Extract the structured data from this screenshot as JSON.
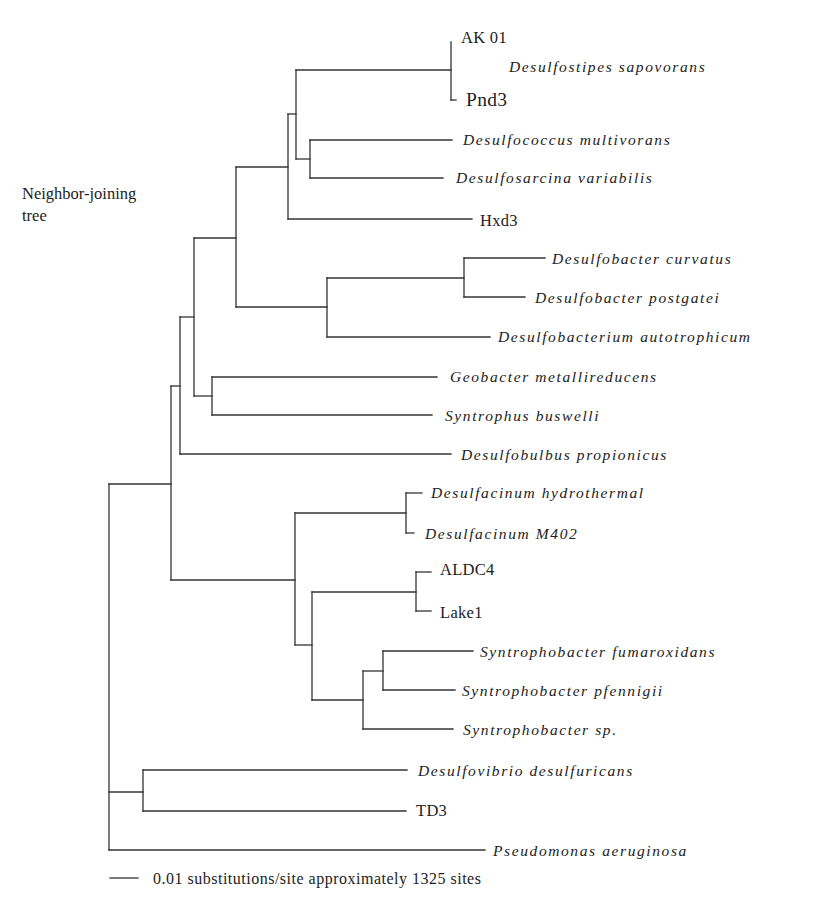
{
  "figure": {
    "title_lines": [
      "Neighbor-joining",
      "tree"
    ],
    "title_pos": {
      "x": 22,
      "y1": 193,
      "y2": 215
    },
    "line_color": "#333333",
    "text_color": "#222222"
  },
  "scale_bar": {
    "x1": 110,
    "x2": 138,
    "y": 878,
    "value": "0.01",
    "label": "0.01 substitutions/site approximately 1325 sites",
    "text_x": 153
  },
  "chart_data": {
    "type": "tree",
    "method": "Neighbor-joining",
    "title": "Neighbor-joining tree",
    "scale": "0.01 substitutions/site",
    "alignment_sites": 1325,
    "scale_label": "0.01 substitutions/site approximately 1325 sites",
    "newick": "((((((AK01,Pnd3)Desulfostipes_sapovorans,(Desulfococcus_multivorans,Desulfosarcina_variabilis)),Hxd3),((Desulfobacter_curvatus,Desulfobacter_postgatei),Desulfobacterium_autotrophicum)),(Geobacter_metallireducens,Syntrophus_buswelli)),Desulfobulbus_propionicus),((Desulfacinum_hydrothermal,Desulfacinum_M402),((ALDC4,Lake1),((Syntrophobacter_fumaroxidans,Syntrophobacter_pfennigii),Syntrophobacter_sp)))),(Desulfovibrio_desulfuricans,TD3),Pseudomonas_aeruginosa);",
    "taxa": [
      "AK 01",
      "Pnd3",
      "Desulfococcus multivorans",
      "Desulfosarcina variabilis",
      "Hxd3",
      "Desulfobacter curvatus",
      "Desulfobacter postgatei",
      "Desulfobacterium autotrophicum",
      "Geobacter metallireducens",
      "Syntrophus buswelli",
      "Desulfobulbus propionicus",
      "Desulfacinum hydrothermal",
      "Desulfacinum M402",
      "ALDC4",
      "Lake1",
      "Syntrophobacter fumaroxidans",
      "Syntrophobacter pfennigii",
      "Syntrophobacter sp.",
      "Desulfovibrio desulfuricans",
      "TD3",
      "Pseudomonas aeruginosa"
    ],
    "clade_labels": [
      {
        "label": "Desulfostipes sapovorans",
        "members": [
          "AK 01",
          "Pnd3"
        ]
      }
    ],
    "outgroup": "Pseudomonas aeruginosa"
  },
  "labels": [
    {
      "id": "ak01",
      "text": "AK 01",
      "x": 461,
      "y": 37,
      "style": "roman"
    },
    {
      "id": "desulfostipes",
      "text": "Desulfostipes sapovorans",
      "x": 509,
      "y": 66,
      "style": "italic"
    },
    {
      "id": "pnd3",
      "text": "Pnd3",
      "x": 466,
      "y": 99,
      "style": "roman large"
    },
    {
      "id": "desulfococcus",
      "text": "Desulfococcus multivorans",
      "x": 463,
      "y": 139,
      "style": "italic"
    },
    {
      "id": "desulfosarcina",
      "text": "Desulfosarcina variabilis",
      "x": 456,
      "y": 177,
      "style": "italic"
    },
    {
      "id": "hxd3",
      "text": "Hxd3",
      "x": 480,
      "y": 220,
      "style": "roman"
    },
    {
      "id": "dcurvatus",
      "text": "Desulfobacter curvatus",
      "x": 552,
      "y": 258,
      "style": "italic"
    },
    {
      "id": "dpostgatei",
      "text": "Desulfobacter postgatei",
      "x": 535,
      "y": 297,
      "style": "italic"
    },
    {
      "id": "dautotrophicum",
      "text": "Desulfobacterium autotrophicum",
      "x": 498,
      "y": 336,
      "style": "italic"
    },
    {
      "id": "geobacter",
      "text": "Geobacter metallireducens",
      "x": 450,
      "y": 376,
      "style": "italic"
    },
    {
      "id": "syntrophus",
      "text": "Syntrophus buswelli",
      "x": 445,
      "y": 415,
      "style": "italic"
    },
    {
      "id": "desulfobulbus",
      "text": "Desulfobulbus propionicus",
      "x": 461,
      "y": 454,
      "style": "italic"
    },
    {
      "id": "dhydrothermal",
      "text": "Desulfacinum hydrothermal",
      "x": 431,
      "y": 492,
      "style": "italic"
    },
    {
      "id": "dm402",
      "text": "Desulfacinum M402",
      "x": 425,
      "y": 533,
      "style": "italic"
    },
    {
      "id": "aldc4",
      "text": "ALDC4",
      "x": 440,
      "y": 569,
      "style": "roman"
    },
    {
      "id": "lake1",
      "text": "Lake1",
      "x": 440,
      "y": 612,
      "style": "roman"
    },
    {
      "id": "sfumaroxidans",
      "text": "Syntrophobacter fumaroxidans",
      "x": 480,
      "y": 651,
      "style": "italic"
    },
    {
      "id": "spfennigii",
      "text": "Syntrophobacter pfennigii",
      "x": 462,
      "y": 690,
      "style": "italic"
    },
    {
      "id": "ssp",
      "text": "Syntrophobacter sp.",
      "x": 463,
      "y": 729,
      "style": "italic"
    },
    {
      "id": "desulfovibrio",
      "text": "Desulfovibrio desulfuricans",
      "x": 418,
      "y": 770,
      "style": "italic"
    },
    {
      "id": "td3",
      "text": "TD3",
      "x": 416,
      "y": 810,
      "style": "roman"
    },
    {
      "id": "pseudomonas",
      "text": "Pseudomonas aeruginosa",
      "x": 493,
      "y": 850,
      "style": "italic"
    }
  ],
  "branches": [
    {
      "id": "root-v",
      "d": "M109 484 V850"
    },
    {
      "id": "root-to-ingroup",
      "d": "M109 484 H171"
    },
    {
      "id": "root-to-dv-td3",
      "d": "M109 792 H143"
    },
    {
      "id": "root-to-pseudomonas",
      "d": "M109 850 H485"
    },
    {
      "id": "node171-v",
      "d": "M171 386 V580"
    },
    {
      "id": "node171-to-180",
      "d": "M171 386 H180"
    },
    {
      "id": "node171-to-295",
      "d": "M171 580 H295"
    },
    {
      "id": "node180-v",
      "d": "M180 317 V454"
    },
    {
      "id": "node180-to-194",
      "d": "M180 317 H194"
    },
    {
      "id": "desulfobulbus-branch",
      "d": "M180 454 H451"
    },
    {
      "id": "node194-v",
      "d": "M194 238 V396"
    },
    {
      "id": "node194-to-236",
      "d": "M194 238 H236"
    },
    {
      "id": "node194-to-212",
      "d": "M194 396 H212"
    },
    {
      "id": "node212-v",
      "d": "M212 377 V415"
    },
    {
      "id": "geobacter-branch",
      "d": "M212 377 H437"
    },
    {
      "id": "syntrophus-branch",
      "d": "M212 415 H432"
    },
    {
      "id": "node236-v",
      "d": "M236 167 V307"
    },
    {
      "id": "node236-to-288",
      "d": "M236 167 H288"
    },
    {
      "id": "node236-to-327",
      "d": "M236 307 H327"
    },
    {
      "id": "node288-v",
      "d": "M288 114 V219"
    },
    {
      "id": "node288-to-296",
      "d": "M288 114 H296"
    },
    {
      "id": "hxd3-branch",
      "d": "M288 219 H472"
    },
    {
      "id": "node296-v",
      "d": "M296 70 V159"
    },
    {
      "id": "node296-to-451",
      "d": "M296 70 H451"
    },
    {
      "id": "node296-to-310",
      "d": "M296 159 H310"
    },
    {
      "id": "node451-v",
      "d": "M451 42 V100"
    },
    {
      "id": "pnd3-tail",
      "d": "M451 100 H456"
    },
    {
      "id": "node310-v",
      "d": "M310 140 V178"
    },
    {
      "id": "desulfococcus-branch",
      "d": "M310 140 H452"
    },
    {
      "id": "desulfosarcina-branch",
      "d": "M310 178 H443"
    },
    {
      "id": "node327-v",
      "d": "M327 278 V337"
    },
    {
      "id": "node327-to-464",
      "d": "M327 278 H464"
    },
    {
      "id": "dautotrophicum-branch",
      "d": "M327 337 H490"
    },
    {
      "id": "node464-v",
      "d": "M464 258 V297"
    },
    {
      "id": "dcurvatus-branch",
      "d": "M464 258 H545"
    },
    {
      "id": "dpostgatei-branch",
      "d": "M464 297 H525"
    },
    {
      "id": "node295-v",
      "d": "M295 513 V645"
    },
    {
      "id": "node295-to-406",
      "d": "M295 513 H406"
    },
    {
      "id": "node295-to-312",
      "d": "M295 645 H312"
    },
    {
      "id": "node406-v",
      "d": "M406 493 V533"
    },
    {
      "id": "dhydrothermal-branch",
      "d": "M406 493 H422"
    },
    {
      "id": "dm402-branch",
      "d": "M406 533 H414"
    },
    {
      "id": "node312-v",
      "d": "M312 592 V700"
    },
    {
      "id": "node312-to-416",
      "d": "M312 592 H416"
    },
    {
      "id": "node312-to-363",
      "d": "M312 700 H363"
    },
    {
      "id": "node416-v",
      "d": "M416 572 V611"
    },
    {
      "id": "aldc4-branch",
      "d": "M416 572 H431"
    },
    {
      "id": "lake1-branch",
      "d": "M416 611 H431"
    },
    {
      "id": "node363-v",
      "d": "M363 671 V729"
    },
    {
      "id": "node363-to-383",
      "d": "M363 671 H383"
    },
    {
      "id": "ssp-branch",
      "d": "M363 729 H453"
    },
    {
      "id": "node383-v",
      "d": "M383 651 V690"
    },
    {
      "id": "sfumaroxidans-branch",
      "d": "M383 651 H473"
    },
    {
      "id": "spfennigii-branch",
      "d": "M383 690 H455"
    },
    {
      "id": "node143-v",
      "d": "M143 770 V811"
    },
    {
      "id": "desulfovibrio-branch",
      "d": "M143 770 H407"
    },
    {
      "id": "td3-branch",
      "d": "M143 811 H406"
    }
  ]
}
